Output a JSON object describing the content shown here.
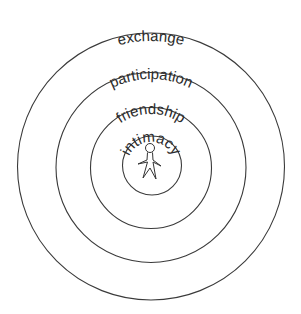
{
  "diagram": {
    "rings": [
      {
        "label": "exchange",
        "radius": 133
      },
      {
        "label": "participation",
        "radius": 96
      },
      {
        "label": "friendship",
        "radius": 61
      },
      {
        "label": "intimacy",
        "radius": 30
      }
    ],
    "center_icon": "person-icon",
    "colors": {
      "stroke": "#3a3a3a",
      "text": "#2b2b2b",
      "background": "#ffffff"
    }
  }
}
